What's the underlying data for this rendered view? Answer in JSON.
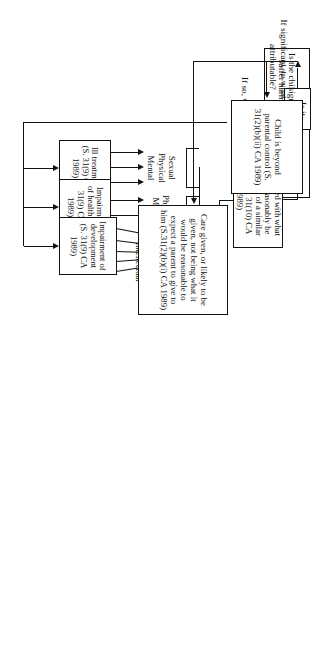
{
  "diagram": {
    "orientation": "rotated-90",
    "nodes": {
      "start": "Is the child suffering harm or likely to suffer harm? (S. 31(2)(a) CA 1989",
      "ill_treatment": "Ill treatment (S. 31(9) CA 1989)",
      "impairment_health": "Impairment of health (S. 31(9) CA 1989)",
      "impairment_development": "Impairment of development (S. 31(9) CA 1989)",
      "compared": "Compared with what could reasonably be expected of a similar child (S. 31(10) CA 1989)",
      "significant": "Is it significant?",
      "beyond_control": "Child is beyond parental control (S. 31(2)(b)(ii) CA 1989)",
      "care_given": "Care given, or likely to be given, not being what it would be reasonable to expect a parent to give to him (S.31(2)(b)(i) CA 1989)"
    },
    "labels": {
      "what_kind": "If so, what kind of harm?",
      "attributable": "If significant, to what is it attributable?"
    },
    "harm_groups": [
      {
        "name": "ill-treatment-types",
        "items": [
          "Sexual",
          "Physical",
          "Mental"
        ]
      },
      {
        "name": "health-impairment-types",
        "items": [
          "Physical",
          "Mental"
        ]
      },
      {
        "name": "development-impairment-types",
        "items": [
          "Physical",
          "Emotional",
          "Behavioural",
          "Social",
          "Intellectual"
        ]
      }
    ],
    "colors": {
      "line": "#111111",
      "background": "#ffffff"
    }
  }
}
